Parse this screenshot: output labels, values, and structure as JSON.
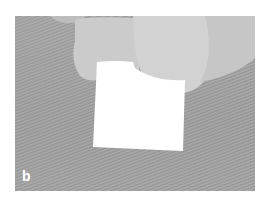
{
  "figure": {
    "panel_label": "b",
    "colors": {
      "background": "#a0a0a0",
      "fingers": "#cfcfcf",
      "patch": "#ffffff",
      "label": "#ffffff"
    }
  }
}
